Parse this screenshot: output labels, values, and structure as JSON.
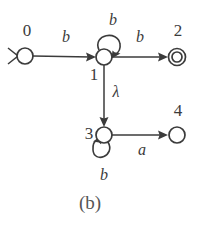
{
  "figure": {
    "caption": "(b)",
    "type": "finite-state-automaton"
  },
  "states": [
    {
      "id": "0",
      "label": "0",
      "cx": 25,
      "cy": 56,
      "r": 8,
      "accepting": false,
      "start": true
    },
    {
      "id": "1",
      "label": "1",
      "cx": 104,
      "cy": 57,
      "r": 8,
      "accepting": false,
      "start": false
    },
    {
      "id": "2",
      "label": "2",
      "cx": 177,
      "cy": 57,
      "r": 8,
      "accepting": true,
      "start": false
    },
    {
      "id": "3",
      "label": "3",
      "cx": 104,
      "cy": 135,
      "r": 8,
      "accepting": false,
      "start": false
    },
    {
      "id": "4",
      "label": "4",
      "cx": 177,
      "cy": 135,
      "r": 8,
      "accepting": false,
      "start": false
    }
  ],
  "transitions": [
    {
      "from": "0",
      "to": "1",
      "symbol": "b",
      "label_x": 66,
      "label_y": 38
    },
    {
      "from": "1",
      "to": "1",
      "symbol": "b",
      "label_x": 113,
      "label_y": 21
    },
    {
      "from": "1",
      "to": "2",
      "symbol": "b",
      "label_x": 140,
      "label_y": 38
    },
    {
      "from": "1",
      "to": "3",
      "symbol": "λ",
      "label_x": 116,
      "label_y": 93
    },
    {
      "from": "3",
      "to": "3",
      "symbol": "b",
      "label_x": 104,
      "label_y": 176
    },
    {
      "from": "3",
      "to": "4",
      "symbol": "a",
      "label_x": 142,
      "label_y": 151
    }
  ],
  "state_label_positions": [
    {
      "id": "0",
      "x": 27,
      "y": 32
    },
    {
      "id": "1",
      "x": 94,
      "y": 76
    },
    {
      "id": "2",
      "x": 178,
      "y": 32
    },
    {
      "id": "3",
      "x": 89,
      "y": 135
    },
    {
      "id": "4",
      "x": 178,
      "y": 112
    }
  ],
  "caption_position": {
    "x": 90,
    "y": 205
  },
  "colors": {
    "ink": "#3b3b3b",
    "caption": "#555555",
    "background": "#ffffff"
  }
}
